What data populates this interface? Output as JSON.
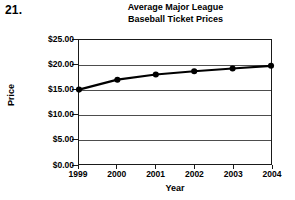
{
  "question_number": "21.",
  "chart_data": {
    "type": "line",
    "title": "Average Major League Baseball Ticket Prices",
    "title_lines": [
      "Average Major League",
      "Baseball Ticket Prices"
    ],
    "xlabel": "Year",
    "ylabel": "Price",
    "categories": [
      "1999",
      "2000",
      "2001",
      "2002",
      "2003",
      "2004"
    ],
    "x": [
      1999,
      2000,
      2001,
      2002,
      2003,
      2004
    ],
    "values": [
      15.0,
      17.0,
      18.05,
      18.7,
      19.25,
      19.8
    ],
    "series": [
      {
        "name": "Average ticket price",
        "values": [
          15.0,
          17.0,
          18.05,
          18.7,
          19.25,
          19.8
        ]
      }
    ],
    "ylim": [
      0,
      25
    ],
    "xlim": [
      1999,
      2004
    ],
    "ytick_values": [
      0,
      5,
      10,
      15,
      20,
      25
    ],
    "ytick_labels": [
      "$0.00",
      "$5.00",
      "$10.00",
      "$15.00",
      "$20.00",
      "$25.00"
    ],
    "xtick_labels": [
      "1999",
      "2000",
      "2001",
      "2002",
      "2003",
      "2004"
    ],
    "grid": "horizontal",
    "legend": "none",
    "marker": "filled-circle",
    "line_color": "#000000",
    "marker_color": "#000000",
    "grid_color": "#4d4d4d",
    "axis_color": "#1a1a1a",
    "background_color": "#ffffff"
  }
}
